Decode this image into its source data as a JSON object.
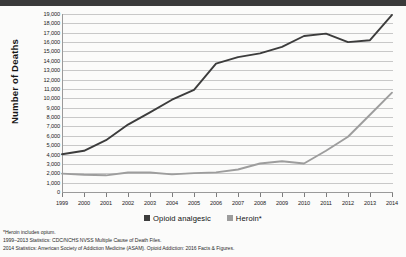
{
  "chart_data": {
    "type": "line",
    "title": "",
    "xlabel": "",
    "ylabel": "Number of Deaths",
    "ylim": [
      0,
      19000
    ],
    "ytick_step": 1000,
    "grid": true,
    "legend_position": "bottom-center",
    "categories": [
      1999,
      2000,
      2001,
      2002,
      2003,
      2004,
      2005,
      2006,
      2007,
      2008,
      2009,
      2010,
      2011,
      2012,
      2013,
      2014
    ],
    "x_tick_labels": [
      "1999",
      "2000",
      "2001",
      "2002",
      "2003",
      "2004",
      "2005",
      "2006",
      "2007",
      "2008",
      "2009",
      "2010",
      "2011",
      "2012",
      "2013",
      "2014"
    ],
    "y_tick_labels": [
      "0",
      "1,000",
      "2,000",
      "3,000",
      "4,000",
      "5,000",
      "6,000",
      "7,000",
      "8,000",
      "9,000",
      "10,000",
      "11,000",
      "12,000",
      "13,000",
      "14,000",
      "15,000",
      "16,000",
      "17,000",
      "18,000",
      "19,000"
    ],
    "series": [
      {
        "name": "Opioid analgesic",
        "color": "#3c3c3c",
        "values": [
          4030,
          4400,
          5530,
          7200,
          8500,
          9850,
          10900,
          13700,
          14400,
          14800,
          15500,
          16650,
          16900,
          16000,
          16200,
          18900
        ]
      },
      {
        "name": "Heroin*",
        "color": "#9d9d9d",
        "values": [
          1960,
          1840,
          1780,
          2080,
          2080,
          1880,
          2010,
          2090,
          2400,
          3040,
          3280,
          3040,
          4400,
          5900,
          8250,
          10600
        ]
      }
    ]
  },
  "legend": {
    "items": [
      {
        "label": "Opioid analgesic",
        "color": "#3c3c3c"
      },
      {
        "label": "Heroin*",
        "color": "#9d9d9d"
      }
    ]
  },
  "footnotes": [
    "*Heroin includes opium.",
    "1999–2013 Statistics: CDC/NCHS NVSS Multiple Cause of Death Files.",
    "2014 Statistics: American Society of Addiction Medicine (ASAM). Opioid Addiction: 2016 Facts & Figures."
  ]
}
